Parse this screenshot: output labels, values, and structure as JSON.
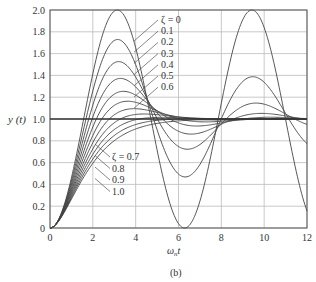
{
  "chart_data": {
    "type": "line",
    "title": "",
    "subtitle": "(b)",
    "xlabel": "ω_n t",
    "ylabel": "y(t)",
    "xlim": [
      0,
      12
    ],
    "ylim": [
      0,
      2
    ],
    "xticks": [
      0,
      2,
      4,
      6,
      8,
      10,
      12
    ],
    "yticks": [
      0,
      0.2,
      0.4,
      0.6,
      0.8,
      1.0,
      1.2,
      1.4,
      1.6,
      1.8,
      2.0
    ],
    "ytick_labels": [
      "0",
      "0.2",
      "0.4",
      "0.6",
      "0.8",
      "1.0",
      "1.2",
      "1.4",
      "1.6",
      "1.8",
      "2.0"
    ],
    "grid": true,
    "series": [
      {
        "name": "ζ = 0",
        "zeta": 0
      },
      {
        "name": "0.1",
        "zeta": 0.1
      },
      {
        "name": "0.2",
        "zeta": 0.2
      },
      {
        "name": "0.3",
        "zeta": 0.3
      },
      {
        "name": "0.4",
        "zeta": 0.4
      },
      {
        "name": "0.5",
        "zeta": 0.5
      },
      {
        "name": "0.6",
        "zeta": 0.6
      },
      {
        "name": "ζ = 0.7",
        "zeta": 0.7
      },
      {
        "name": "0.8",
        "zeta": 0.8
      },
      {
        "name": "0.9",
        "zeta": 0.9
      },
      {
        "name": "1.0",
        "zeta": 1.0
      }
    ],
    "annotations_upper": [
      "ζ = 0",
      "0.1",
      "0.2",
      "0.3",
      "0.4",
      "0.5",
      "0.6"
    ],
    "annotations_lower": [
      "ζ = 0.7",
      "0.8",
      "0.9",
      "1.0"
    ],
    "line_color": "#444444",
    "grid_color": "#bbbbbb"
  },
  "labels": {
    "ylabel": "y (t)",
    "xlabel_main": "ω",
    "xlabel_sub": "n",
    "xlabel_tail": "t",
    "caption": "(b)"
  }
}
